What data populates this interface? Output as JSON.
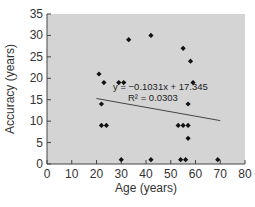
{
  "chart_data": {
    "type": "scatter",
    "title": "",
    "xlabel": "Age (years)",
    "ylabel": "Accuracy (years)",
    "xlim": [
      0,
      80
    ],
    "ylim": [
      0,
      35
    ],
    "xticks": [
      0,
      10,
      20,
      30,
      40,
      50,
      60,
      70,
      80
    ],
    "yticks": [
      0,
      5,
      10,
      15,
      20,
      25,
      30,
      35
    ],
    "grid": false,
    "legend": null,
    "series": [
      {
        "name": "data",
        "marker": "diamond",
        "color": "#111111",
        "points": [
          [
            21,
            21
          ],
          [
            23,
            19
          ],
          [
            29,
            19
          ],
          [
            31,
            19
          ],
          [
            33,
            29
          ],
          [
            42,
            30
          ],
          [
            55,
            27
          ],
          [
            58,
            24
          ],
          [
            59,
            19
          ],
          [
            57,
            14
          ],
          [
            22,
            14
          ],
          [
            22,
            9
          ],
          [
            24,
            9
          ],
          [
            30,
            1
          ],
          [
            42,
            1
          ],
          [
            53,
            9
          ],
          [
            55,
            9
          ],
          [
            57,
            9
          ],
          [
            57,
            6
          ],
          [
            54,
            1
          ],
          [
            56,
            1
          ],
          [
            69,
            1
          ]
        ]
      }
    ],
    "trendline": {
      "type": "linear",
      "slope": -0.1031,
      "intercept": 17.345,
      "x_range": [
        20,
        70
      ],
      "equation_label": "y = −0.1031x + 17.345",
      "r2_label": "R² = 0.0303"
    },
    "plot_background": "#d4d4d4"
  }
}
